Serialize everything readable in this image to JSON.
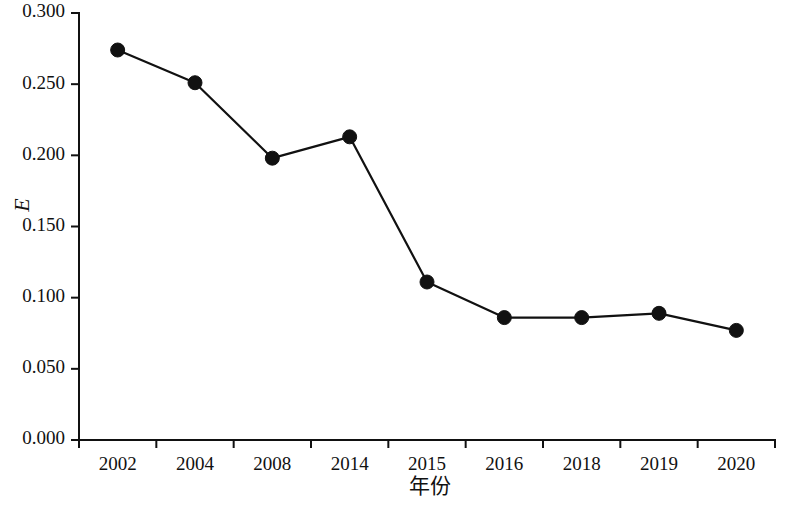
{
  "chart_data": {
    "type": "line",
    "title": "",
    "subtitle": "",
    "xlabel": "年份",
    "ylabel": "E",
    "categories": [
      "2002",
      "2004",
      "2008",
      "2014",
      "2015",
      "2016",
      "2018",
      "2019",
      "2020"
    ],
    "values": [
      0.274,
      0.251,
      0.198,
      0.213,
      0.111,
      0.086,
      0.086,
      0.089,
      0.077
    ],
    "series": [
      {
        "name": "E",
        "values": [
          0.274,
          0.251,
          0.198,
          0.213,
          0.111,
          0.086,
          0.086,
          0.089,
          0.077
        ]
      }
    ],
    "ylim": [
      0.0,
      0.3
    ],
    "ytick_values": [
      0.0,
      0.05,
      0.1,
      0.15,
      0.2,
      0.25,
      0.3
    ],
    "ytick_labels": [
      "0.000",
      "0.050",
      "0.100",
      "0.150",
      "0.200",
      "0.250",
      "0.300"
    ],
    "xtick_labels": [
      "2002",
      "2004",
      "2008",
      "2014",
      "2015",
      "2016",
      "2018",
      "2019",
      "2020"
    ],
    "grid": false,
    "legend": false,
    "legend_position": "none",
    "marker": "filled-circle",
    "line_color": "#111111",
    "marker_color": "#111111",
    "background_color": "#ffffff",
    "annotations": []
  },
  "figure": {
    "axis_title_y": "E",
    "axis_title_x": "年份"
  }
}
